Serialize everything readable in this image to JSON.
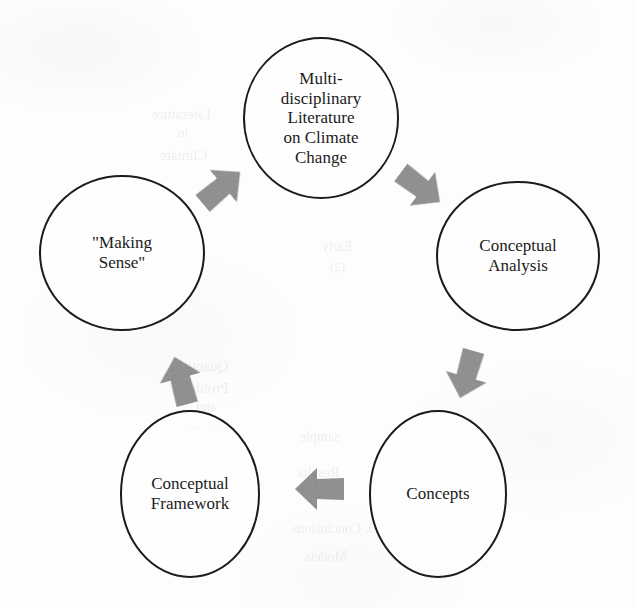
{
  "diagram": {
    "type": "cyclical-process-diagram",
    "shape": "circular-loop",
    "direction": "clockwise",
    "background_color": "#fdfdfd",
    "node_outline_color": "#1a1a1a",
    "node_fill_color": "#ffffff",
    "arrow_color": "#9a9a9a",
    "text_color": "#1b1b1b",
    "nodes": [
      {
        "id": "literature",
        "label": "Multi-\ndisciplinary\nLiterature\non Climate\nChange",
        "cx": 321,
        "cy": 118,
        "rx": 77,
        "ry": 80,
        "font_size": 17
      },
      {
        "id": "conceptual-analysis",
        "label": "Conceptual\nAnalysis",
        "cx": 518,
        "cy": 256,
        "rx": 81,
        "ry": 74,
        "font_size": 17
      },
      {
        "id": "concepts",
        "label": "Concepts",
        "cx": 438,
        "cy": 494,
        "rx": 68,
        "ry": 83,
        "font_size": 17
      },
      {
        "id": "conceptual-framework",
        "label": "Conceptual\nFramework",
        "cx": 190,
        "cy": 494,
        "rx": 69,
        "ry": 83,
        "font_size": 17
      },
      {
        "id": "making-sense",
        "label": "\"Making\nSense\"",
        "cx": 122,
        "cy": 253,
        "rx": 82,
        "ry": 77,
        "font_size": 17
      }
    ],
    "arrows": [
      {
        "id": "framework-to-making-sense",
        "from": "conceptual-framework",
        "to": "making-sense",
        "direction": "up",
        "rotation": -15,
        "cx": 181,
        "cy": 381
      },
      {
        "id": "making-sense-to-literature",
        "from": "making-sense",
        "to": "literature",
        "direction": "up-right",
        "rotation": 50,
        "cx": 221,
        "cy": 188
      },
      {
        "id": "literature-to-analysis",
        "from": "literature",
        "to": "conceptual-analysis",
        "direction": "down-right",
        "rotation": 127,
        "cx": 420,
        "cy": 187
      },
      {
        "id": "analysis-to-concepts",
        "from": "conceptual-analysis",
        "to": "concepts",
        "direction": "down-left",
        "rotation": 196,
        "cx": 467,
        "cy": 374
      },
      {
        "id": "concepts-to-framework",
        "from": "concepts",
        "to": "conceptual-framework",
        "direction": "left",
        "rotation": 270,
        "cx": 320,
        "cy": 489
      }
    ],
    "bleed_through_text": [
      {
        "text": "Literature",
        "x": 152,
        "y": 104,
        "size": 15
      },
      {
        "text": "in",
        "x": 178,
        "y": 124,
        "size": 13
      },
      {
        "text": "Climate",
        "x": 160,
        "y": 145,
        "size": 15
      },
      {
        "text": "Early",
        "x": 322,
        "y": 238,
        "size": 14
      },
      {
        "text": "(2)",
        "x": 330,
        "y": 258,
        "size": 13
      },
      {
        "text": "Quantity",
        "x": 176,
        "y": 356,
        "size": 15
      },
      {
        "text": "Problems",
        "x": 172,
        "y": 378,
        "size": 15
      },
      {
        "text": "and",
        "x": 196,
        "y": 398,
        "size": 14
      },
      {
        "text": "Process",
        "x": 182,
        "y": 418,
        "size": 15
      },
      {
        "text": "sample",
        "x": 300,
        "y": 428,
        "size": 14
      },
      {
        "text": "Results",
        "x": 298,
        "y": 464,
        "size": 14
      },
      {
        "text": "3. Conclusions",
        "x": 292,
        "y": 520,
        "size": 14
      },
      {
        "text": "Models",
        "x": 305,
        "y": 548,
        "size": 14
      }
    ]
  }
}
